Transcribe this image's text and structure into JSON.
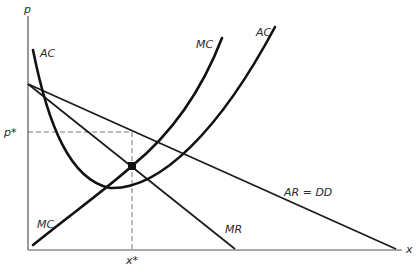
{
  "diagram": {
    "type": "monopolistic-competition-equilibrium",
    "axes": {
      "y_label": "p",
      "x_label": "x"
    },
    "curves": [
      {
        "id": "AC",
        "label": "AC",
        "label_top": "AC",
        "shape": "U-shaped"
      },
      {
        "id": "MC",
        "label": "MC",
        "label_top": "MC",
        "shape": "upward-sloping convex"
      },
      {
        "id": "AR",
        "label": "AR = DD",
        "shape": "downward line"
      },
      {
        "id": "MR",
        "label": "MR",
        "shape": "downward line, steeper"
      }
    ],
    "equilibrium": {
      "price_label": "p*",
      "quantity_label": "x*"
    },
    "colors": {
      "curve": "#111111",
      "axis": "#555555",
      "dashed_guide": "#777777",
      "background": "#ffffff"
    }
  }
}
